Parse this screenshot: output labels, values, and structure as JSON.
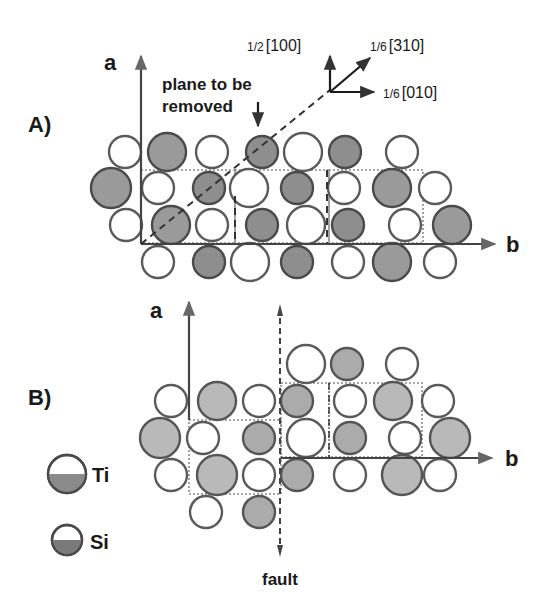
{
  "figure": {
    "panel_a_label": "A)",
    "panel_b_label": "B)",
    "axis_a_label": "a",
    "axis_b_label": "b",
    "plane_note_line1": "plane to be",
    "plane_note_line2": "removed",
    "fault_label": "fault",
    "vectors": {
      "v100": {
        "frac": "1/2",
        "index": "[100]"
      },
      "v310": {
        "frac": "1/6",
        "index": "[310]"
      },
      "v010": {
        "frac": "1/6",
        "index": "[010]"
      }
    },
    "legend": [
      {
        "label": "Ti",
        "icon": "half-filled-large-circle"
      },
      {
        "label": "Si",
        "icon": "half-filled-small-circle"
      }
    ],
    "colors": {
      "ink": "#1a1a1a",
      "open_atom_fill": "#ffffff",
      "filled_atom_panel_a": "#9a9a9a",
      "filled_atom_panel_b": "#b9b9b9",
      "cell_outline": "#8a8a8a"
    }
  },
  "panel_a_atoms": [
    [
      125,
      152,
      16,
      0
    ],
    [
      167,
      152,
      19,
      1
    ],
    [
      212,
      152,
      16,
      0
    ],
    [
      262,
      152,
      16,
      1
    ],
    [
      303,
      152,
      19,
      0
    ],
    [
      345,
      152,
      16,
      1
    ],
    [
      402,
      152,
      16,
      0
    ],
    [
      111,
      188,
      20,
      1
    ],
    [
      158,
      188,
      16,
      0
    ],
    [
      209,
      188,
      16,
      1
    ],
    [
      249,
      188,
      19,
      0
    ],
    [
      297,
      188,
      16,
      1
    ],
    [
      344,
      188,
      16,
      0
    ],
    [
      392,
      188,
      19,
      1
    ],
    [
      435,
      188,
      16,
      0
    ],
    [
      126,
      225,
      16,
      0
    ],
    [
      171,
      225,
      19,
      1
    ],
    [
      212,
      225,
      16,
      0
    ],
    [
      262,
      225,
      16,
      1
    ],
    [
      306,
      225,
      19,
      0
    ],
    [
      348,
      225,
      16,
      1
    ],
    [
      405,
      225,
      16,
      0
    ],
    [
      452,
      225,
      19,
      1
    ],
    [
      158,
      262,
      16,
      0
    ],
    [
      209,
      262,
      16,
      1
    ],
    [
      250,
      262,
      19,
      0
    ],
    [
      297,
      262,
      16,
      1
    ],
    [
      348,
      262,
      16,
      0
    ],
    [
      392,
      262,
      19,
      1
    ],
    [
      440,
      262,
      16,
      0
    ]
  ],
  "panel_b_atoms": [
    [
      306,
      364,
      19,
      0
    ],
    [
      347,
      364,
      16,
      1
    ],
    [
      402,
      364,
      16,
      0
    ],
    [
      171,
      401,
      16,
      0
    ],
    [
      217,
      401,
      19,
      1
    ],
    [
      259,
      401,
      16,
      0
    ],
    [
      297,
      401,
      16,
      1
    ],
    [
      350,
      401,
      16,
      0
    ],
    [
      393,
      401,
      19,
      1
    ],
    [
      438,
      401,
      16,
      0
    ],
    [
      160,
      438,
      20,
      1
    ],
    [
      203,
      438,
      16,
      0
    ],
    [
      259,
      438,
      16,
      1
    ],
    [
      306,
      438,
      19,
      0
    ],
    [
      350,
      438,
      16,
      1
    ],
    [
      405,
      438,
      16,
      0
    ],
    [
      450,
      438,
      20,
      1
    ],
    [
      171,
      475,
      16,
      0
    ],
    [
      217,
      475,
      20,
      1
    ],
    [
      259,
      475,
      16,
      0
    ],
    [
      297,
      475,
      16,
      1
    ],
    [
      350,
      475,
      16,
      0
    ],
    [
      402,
      475,
      20,
      1
    ],
    [
      440,
      475,
      16,
      0
    ],
    [
      206,
      512,
      16,
      0
    ],
    [
      259,
      512,
      16,
      1
    ]
  ]
}
